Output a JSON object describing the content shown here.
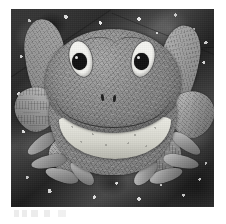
{
  "image": {
    "title": "Appliqued frog quilt block",
    "medium": "Black and white photograph of a fabric quilt block",
    "alt_text": "Grayscale photo of a pieced and appliqued frog facing forward with raised arms, splayed webbed feet, large white eyes with black pupils and a wide smile, set against a dark mottled star-speckled fabric background.",
    "color_mode": "grayscale",
    "orientation": "portrait",
    "frame": {
      "background": "#ffffff",
      "photo_left": 11,
      "photo_top": 9,
      "photo_width": 203,
      "photo_height": 198
    }
  },
  "palette": {
    "paper_white": "#ffffff",
    "background_dark": "#3b3b3b",
    "background_mid": "#4e4e4e",
    "speckle_white": "#f5f5f5",
    "frog_body_gray": "#8d8d8d",
    "frog_limb_gray": "#9a9a9a",
    "eye_white": "#f4f4f0",
    "pupil_black": "#111111",
    "chin_light": "#dcdcd4",
    "seam_line": "#232323"
  },
  "subject": {
    "name": "frog",
    "pose": "front-facing, arms raised, legs splayed",
    "parts": [
      {
        "id": "head",
        "label": "Frog head",
        "tone": "mid gray mottled"
      },
      {
        "id": "body",
        "label": "Frog body",
        "tone": "mid gray mottled"
      },
      {
        "id": "eye-left",
        "label": "Left eye",
        "tone": "white with black pupil"
      },
      {
        "id": "eye-right",
        "label": "Right eye",
        "tone": "white with black pupil"
      },
      {
        "id": "nostrils",
        "label": "Nostrils",
        "tone": "dark"
      },
      {
        "id": "mouth",
        "label": "Smiling mouth line",
        "tone": "dark stitched line"
      },
      {
        "id": "chin",
        "label": "Light speckled chin patch",
        "tone": "light gray dotted"
      },
      {
        "id": "arm-left",
        "label": "Left raised arm",
        "tone": "light gray"
      },
      {
        "id": "arm-right",
        "label": "Right raised arm",
        "tone": "light gray"
      },
      {
        "id": "leg-left",
        "label": "Left leg and toes",
        "tone": "mid gray"
      },
      {
        "id": "leg-right",
        "label": "Right leg and toes",
        "tone": "mid gray"
      }
    ]
  },
  "background": {
    "label": "Star-speckled dark fabric",
    "description": "Dark mottled cloth printed with scattered white dots resembling a night sky",
    "seam_count": 3
  }
}
